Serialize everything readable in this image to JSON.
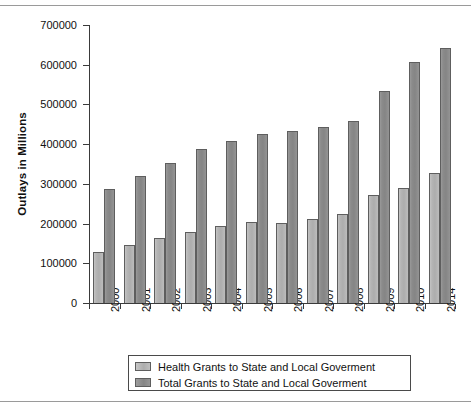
{
  "chart_data": {
    "type": "bar",
    "title": "",
    "xlabel": "",
    "ylabel": "Outlays in Millions",
    "ylim": [
      0,
      700000
    ],
    "ytick_labels": [
      "0",
      "100000",
      "200000",
      "300000",
      "400000",
      "500000",
      "600000",
      "700000"
    ],
    "ytick_values": [
      0,
      100000,
      200000,
      300000,
      400000,
      500000,
      600000,
      700000
    ],
    "grid": false,
    "legend_position": "bottom",
    "categories": [
      "2000",
      "2001",
      "2002",
      "2003",
      "2004",
      "2005",
      "2006",
      "2007",
      "2008",
      "2009",
      "2010",
      "2014"
    ],
    "series": [
      {
        "name": "Health Grants to State and Local Goverment",
        "color": "#b3b3b3",
        "values": [
          128000,
          145000,
          163000,
          179000,
          195000,
          205000,
          202000,
          212000,
          224000,
          273000,
          290000,
          327000
        ]
      },
      {
        "name": "Total Grants to State and Local Goverment",
        "color": "#8a8a8a",
        "values": [
          286000,
          320000,
          353000,
          388000,
          408000,
          426000,
          433000,
          443000,
          459000,
          535000,
          606000,
          642000
        ]
      }
    ]
  },
  "legend": {
    "items": [
      {
        "label": "Health Grants to State and Local Goverment",
        "swatch": "health"
      },
      {
        "label": "Total Grants to State and Local Goverment",
        "swatch": "total"
      }
    ]
  }
}
